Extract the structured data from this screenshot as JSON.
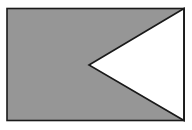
{
  "figure": {
    "title": "gray-rectangle-with-white-triangular-notch",
    "canvas": {
      "width": 192,
      "height": 130,
      "background_color": "#ffffff"
    },
    "shapes": {
      "rectangle": {
        "name": "gray-rectangle",
        "x": 7,
        "y": 8.5,
        "width": 177,
        "height": 112,
        "fill_color": "#969696",
        "stroke_color": "#1a1a1a",
        "stroke_width": 1.6,
        "corners": {
          "top_left": [
            7,
            8.5
          ],
          "top_right": [
            184,
            8.5
          ],
          "bottom_right": [
            184,
            120.5
          ],
          "bottom_left": [
            7,
            120.5
          ]
        }
      },
      "triangle": {
        "name": "white-triangle-notch",
        "fill_color": "#ffffff",
        "stroke_color": "#1a1a1a",
        "stroke_width": 1.6,
        "orientation": "apex-pointing-left",
        "vertices": {
          "apex": [
            89,
            65
          ],
          "top": [
            184,
            8.5
          ],
          "bottom": [
            184,
            120.5
          ]
        },
        "points": "89,65 184,8.5 184,120.5"
      }
    }
  }
}
